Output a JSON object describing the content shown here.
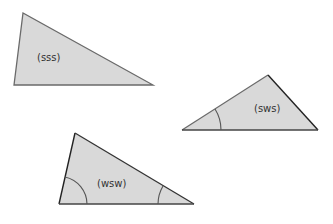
{
  "diagram": {
    "background": "#ffffff",
    "fill_color": "#d9d9d9",
    "stroke_color": "#555555",
    "dark_stroke_color": "#222222",
    "triangles": [
      {
        "id": "sss",
        "label": "(sss)",
        "points": [
          [
            23,
            13
          ],
          [
            14,
            85
          ],
          [
            153,
            85
          ]
        ],
        "label_pos": [
          37,
          61
        ],
        "angle_arcs": []
      },
      {
        "id": "sws",
        "label": "(sws)",
        "points": [
          [
            182,
            130
          ],
          [
            268,
            75
          ],
          [
            318,
            130
          ]
        ],
        "label_pos": [
          254,
          112
        ],
        "angle_arcs": [
          {
            "vertex": "left",
            "radius": 39
          }
        ]
      },
      {
        "id": "wsw",
        "label": "(wsw)",
        "points": [
          [
            75,
            133
          ],
          [
            59,
            204
          ],
          [
            194,
            204
          ]
        ],
        "label_pos": [
          97,
          187
        ],
        "angle_arcs": [
          {
            "vertex": "left-base",
            "radius": 28
          },
          {
            "vertex": "right-base",
            "radius": 36
          }
        ]
      }
    ]
  }
}
